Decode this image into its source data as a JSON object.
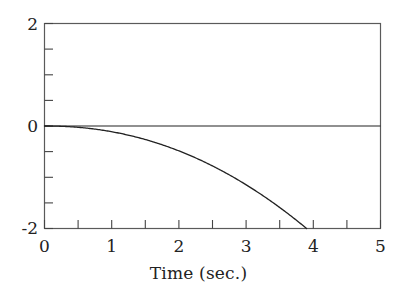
{
  "chart_data": {
    "type": "line",
    "title": "",
    "subtitle": "",
    "xlabel": "Time (sec.)",
    "ylabel": "",
    "xlim": [
      0,
      5
    ],
    "ylim": [
      -2,
      2
    ],
    "grid": false,
    "legend": null,
    "x_ticks": [
      0,
      0.5,
      1,
      1.5,
      2,
      2.5,
      3,
      3.5,
      4,
      4.5,
      5
    ],
    "x_tick_labels": [
      "0",
      "",
      "1",
      "",
      "2",
      "",
      "3",
      "",
      "4",
      "",
      "5"
    ],
    "x_major_labels": [
      "0",
      "1",
      "2",
      "3",
      "4",
      "5"
    ],
    "x_major_values": [
      0,
      1,
      2,
      3,
      4,
      5
    ],
    "y_ticks": [
      -2,
      -1.5,
      -1,
      -0.5,
      0,
      0.5,
      1,
      1.5,
      2
    ],
    "y_tick_labels": [
      "-2",
      "",
      "",
      "",
      "0",
      "",
      "",
      "",
      "2"
    ],
    "y_major_labels": [
      "2",
      "0",
      "-2"
    ],
    "y_major_values": [
      2,
      0,
      -2
    ],
    "series": [
      {
        "name": "zero-reference",
        "style": "horizontal-line",
        "color": "#222222",
        "x": [
          0,
          5
        ],
        "values": [
          0,
          0
        ]
      },
      {
        "name": "response",
        "style": "curve",
        "color": "#222222",
        "x": [
          0,
          0.25,
          0.5,
          0.75,
          1,
          1.25,
          1.5,
          1.75,
          2,
          2.25,
          2.5,
          2.75,
          3,
          3.25,
          3.5,
          3.75,
          3.9
        ],
        "values": [
          0,
          -0.008,
          -0.033,
          -0.075,
          -0.132,
          -0.206,
          -0.297,
          -0.404,
          -0.527,
          -0.667,
          -0.823,
          -0.996,
          -1.185,
          -1.39,
          -1.612,
          -1.85,
          -2.0
        ]
      }
    ]
  },
  "axes": {
    "frame_color": "#555555",
    "tick_color": "#444444",
    "curve_color": "#222222"
  }
}
